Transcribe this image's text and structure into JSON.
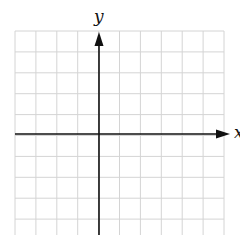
{
  "chart_data": {
    "type": "coordinate-grid",
    "title": "",
    "xlabel": "x",
    "ylabel": "y",
    "grid": true,
    "grid_columns": 10,
    "grid_rows": 10,
    "y_axis_column": 4,
    "x_axis_row": 5,
    "tick_labels": [],
    "series": []
  },
  "labels": {
    "x_axis": "x",
    "y_axis": "y"
  },
  "colors": {
    "grid": "#d4d4d4",
    "axis": "#111111",
    "background": "#ffffff"
  }
}
